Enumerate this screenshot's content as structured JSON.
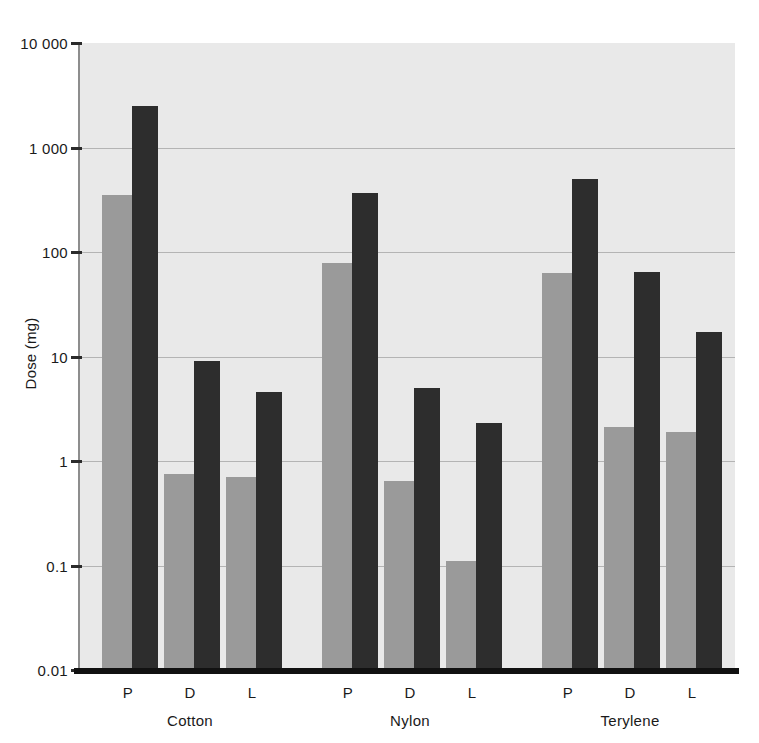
{
  "chart_data": {
    "type": "bar",
    "title": "",
    "xlabel": "",
    "ylabel": "Dose (mg)",
    "yscale": "log",
    "ylim": [
      0.01,
      10000
    ],
    "ytick_labels": [
      "10 000",
      "1 000",
      "100",
      "10",
      "1",
      "0.1",
      "0.01"
    ],
    "ytick_values": [
      10000,
      1000,
      100,
      10,
      1,
      0.1,
      0.01
    ],
    "grid": true,
    "legend": "none",
    "groups": [
      "Cotton",
      "Nylon",
      "Terylene"
    ],
    "categories": [
      "P",
      "D",
      "L",
      "P",
      "D",
      "L",
      "P",
      "D",
      "L"
    ],
    "series": [
      {
        "name": "lower",
        "color": "#9a9a9a",
        "values": [
          350,
          0.75,
          0.7,
          78,
          0.65,
          0.11,
          63,
          2.1,
          1.9
        ]
      },
      {
        "name": "upper",
        "color": "#2d2d2d",
        "values": [
          2500,
          9.0,
          4.6,
          370,
          5.0,
          2.3,
          500,
          65,
          17
        ]
      }
    ],
    "bars": [
      {
        "group": "Cotton",
        "category": "P",
        "gray": 350,
        "dark": 2500
      },
      {
        "group": "Cotton",
        "category": "D",
        "gray": 0.75,
        "dark": 9.0
      },
      {
        "group": "Cotton",
        "category": "L",
        "gray": 0.7,
        "dark": 4.6
      },
      {
        "group": "Nylon",
        "category": "P",
        "gray": 78,
        "dark": 370
      },
      {
        "group": "Nylon",
        "category": "D",
        "gray": 0.65,
        "dark": 5.0
      },
      {
        "group": "Nylon",
        "category": "L",
        "gray": 0.11,
        "dark": 2.3
      },
      {
        "group": "Terylene",
        "category": "P",
        "gray": 63,
        "dark": 500
      },
      {
        "group": "Terylene",
        "category": "D",
        "gray": 2.1,
        "dark": 65
      },
      {
        "group": "Terylene",
        "category": "L",
        "gray": 1.9,
        "dark": 17
      }
    ]
  },
  "axis": {
    "y_label": "Dose (mg)",
    "ticks": [
      {
        "label": "10 000",
        "value": 10000
      },
      {
        "label": "1 000",
        "value": 1000
      },
      {
        "label": "100",
        "value": 100
      },
      {
        "label": "10",
        "value": 10
      },
      {
        "label": "1",
        "value": 1
      },
      {
        "label": "0.1",
        "value": 0.1
      },
      {
        "label": "0.01",
        "value": 0.01
      }
    ]
  },
  "x_axis": {
    "sub_labels": [
      "P",
      "D",
      "L",
      "P",
      "D",
      "L",
      "P",
      "D",
      "L"
    ],
    "group_labels": [
      "Cotton",
      "Nylon",
      "Terylene"
    ]
  },
  "style": {
    "plot_background": "#e9e9e9",
    "gridline_color": "#b4b4b4",
    "gray_bar_color": "#9a9a9a",
    "dark_bar_color": "#2d2d2d",
    "axis_color": "#111111",
    "page_background": "#ffffff"
  }
}
